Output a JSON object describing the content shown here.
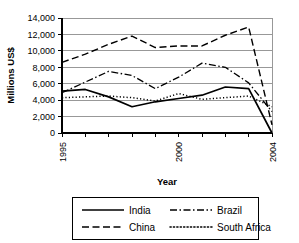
{
  "chart_data": {
    "type": "line",
    "title": "",
    "xlabel": "Year",
    "ylabel": "Millions US$",
    "x": [
      1995,
      1996,
      1997,
      1998,
      1999,
      2000,
      2001,
      2002,
      2003,
      2004
    ],
    "xlim": [
      1995,
      2004
    ],
    "ylim": [
      0,
      14000
    ],
    "ytick_labels": [
      "0",
      "2,000",
      "4,000",
      "6,000",
      "8,000",
      "10,000",
      "12,000",
      "14,000"
    ],
    "ytick_values": [
      0,
      2000,
      4000,
      6000,
      8000,
      10000,
      12000,
      14000
    ],
    "xtick_labels": [
      "1995",
      "2000",
      "2004"
    ],
    "xtick_label_values": [
      1995,
      2000,
      2004
    ],
    "grid": "horizontal",
    "legend_position": "below",
    "series": [
      {
        "name": "India",
        "style": "solid",
        "values": [
          5100,
          5300,
          4400,
          3200,
          3800,
          4200,
          4600,
          5600,
          5400,
          0
        ]
      },
      {
        "name": "China",
        "style": "dashed",
        "values": [
          8600,
          9600,
          10800,
          11800,
          10400,
          10600,
          10600,
          11900,
          12900,
          1000
        ]
      },
      {
        "name": "Brazil",
        "style": "dashdot",
        "values": [
          4900,
          6200,
          7500,
          7000,
          5400,
          6800,
          8500,
          8000,
          6100,
          2600
        ]
      },
      {
        "name": "South Africa",
        "style": "dotted",
        "values": [
          4300,
          4400,
          4500,
          4300,
          3900,
          4800,
          4100,
          4300,
          4500,
          3200
        ]
      }
    ]
  },
  "legend": {
    "entries": [
      {
        "label": "India",
        "style": "solid"
      },
      {
        "label": "Brazil",
        "style": "dashdot"
      },
      {
        "label": "China",
        "style": "dashed"
      },
      {
        "label": "South Africa",
        "style": "dotted"
      }
    ]
  }
}
